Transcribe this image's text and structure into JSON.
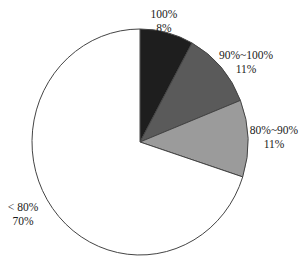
{
  "chart_data": {
    "type": "pie",
    "title": "",
    "start_angle_deg": 0,
    "direction": "clockwise",
    "categories": [
      "100%",
      "90%~100%",
      "80%~90%",
      "< 80%"
    ],
    "values": [
      8,
      11,
      11,
      70
    ],
    "value_labels": [
      "8%",
      "11%",
      "11%",
      "70%"
    ],
    "colors": [
      "#1e1e1e",
      "#5a5a5a",
      "#9b9b9b",
      "#ffffff"
    ],
    "outline_color": "#444444",
    "legend": "none",
    "labels_position": "outside"
  },
  "labels": [
    {
      "category": "100%",
      "value": "8%",
      "x": 164,
      "y": 7
    },
    {
      "category": "90%~100%",
      "value": "11%",
      "x": 246,
      "y": 48
    },
    {
      "category": "80%~90%",
      "value": "11%",
      "x": 274,
      "y": 123
    },
    {
      "category": "< 80%",
      "value": "70%",
      "x": 23,
      "y": 200
    }
  ],
  "geometry": {
    "cx": 140,
    "cy": 142,
    "rx": 108,
    "ry": 113
  }
}
